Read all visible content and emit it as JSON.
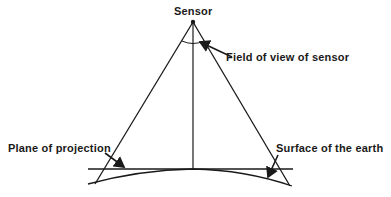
{
  "labels": {
    "sensor": "Sensor",
    "field_of_view": "Field of view of sensor",
    "plane_of_projection": "Plane of projection",
    "surface_of_earth": "Surface of the earth"
  },
  "colors": {
    "line": "#1a1a1a",
    "background": "#ffffff"
  }
}
